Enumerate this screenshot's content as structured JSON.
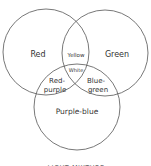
{
  "diagram": {
    "type": "venn",
    "caption": "LIGHT MIXTURE",
    "circles": [
      {
        "name": "red",
        "label": "Red"
      },
      {
        "name": "green",
        "label": "Green"
      },
      {
        "name": "purple-blue",
        "label": "Purple-blue"
      }
    ],
    "regions": {
      "red_green": "Yellow",
      "center": "White",
      "red_purple_line1": "Red-",
      "red_purple_line2": "purple",
      "green_purple_line1": "Blue-",
      "green_purple_line2": "green"
    },
    "colors": {
      "stroke": "#444444",
      "text": "#333333",
      "background": "#ffffff"
    }
  }
}
